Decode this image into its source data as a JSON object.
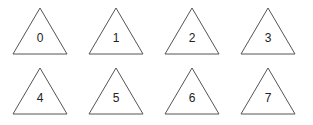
{
  "diagram": {
    "stroke_color": "#555555",
    "triangles": [
      {
        "label": "0",
        "x": 12,
        "y": 7
      },
      {
        "label": "1",
        "x": 88,
        "y": 7
      },
      {
        "label": "2",
        "x": 164,
        "y": 7
      },
      {
        "label": "3",
        "x": 240,
        "y": 7
      },
      {
        "label": "4",
        "x": 12,
        "y": 67
      },
      {
        "label": "5",
        "x": 88,
        "y": 67
      },
      {
        "label": "6",
        "x": 164,
        "y": 67
      },
      {
        "label": "7",
        "x": 240,
        "y": 67
      }
    ]
  }
}
